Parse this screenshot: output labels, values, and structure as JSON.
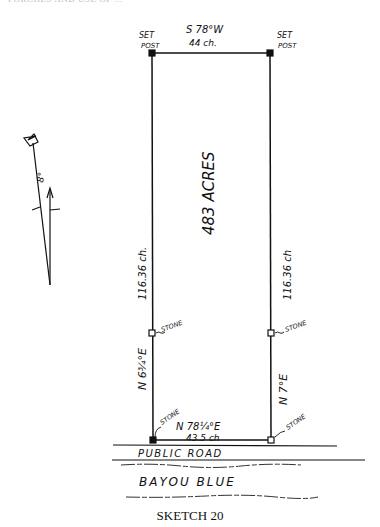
{
  "page": {
    "header_text": "PORCHES AND USE OF ...",
    "caption": "SKETCH 20"
  },
  "sketch": {
    "top_left_label": [
      "SET",
      "POST"
    ],
    "top_right_label": [
      "SET",
      "POST"
    ],
    "top_bearing": "S 78°W",
    "top_distance": "44 ch.",
    "area_label": "483 ACRES",
    "left_distance": "116.36 ch.",
    "right_distance": "116.36 ch",
    "left_bearing": "N 6¾°E",
    "right_bearing": "N 7°E",
    "left_mid_marker": "STONE",
    "right_mid_marker": "STONE",
    "bottom_left_marker": "STONE",
    "bottom_right_marker": "STONE",
    "bottom_bearing": "N 78¼°E",
    "bottom_distance": "43.5 ch",
    "road_label": "PUBLIC ROAD",
    "waterway_label": "BAYOU BLUE",
    "north_arrow_angle": "8°"
  }
}
